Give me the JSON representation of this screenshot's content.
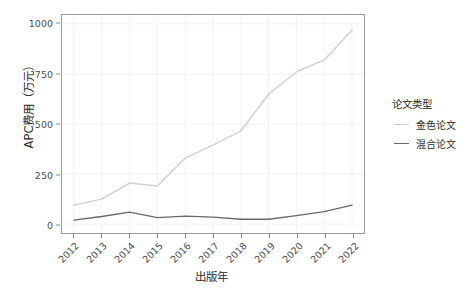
{
  "chart_data": {
    "type": "line",
    "title": "",
    "xlabel": "出版年",
    "ylabel": "APC费用（万元）",
    "categories": [
      "2012",
      "2013",
      "2014",
      "2015",
      "2016",
      "2017",
      "2018",
      "2019",
      "2020",
      "2021",
      "2022"
    ],
    "x": [
      2012,
      2013,
      2014,
      2015,
      2016,
      2017,
      2018,
      2019,
      2020,
      2021,
      2022
    ],
    "xlim": [
      2012,
      2022
    ],
    "ylim": [
      0,
      1000
    ],
    "yticks": [
      0,
      250,
      500,
      750,
      1000
    ],
    "ytick_labels": [
      "0",
      "250",
      "500",
      "750",
      "1000"
    ],
    "xtick_labels": [
      "2012",
      "2013",
      "2014",
      "2015",
      "2016",
      "2017",
      "2018",
      "2019",
      "2020",
      "2021",
      "2022"
    ],
    "grid": true,
    "legend_position": "right",
    "legend_title": "论文类型",
    "series": [
      {
        "name": "金色论文",
        "color": "#cfcfcf",
        "values": [
          95,
          125,
          205,
          190,
          330,
          395,
          465,
          650,
          760,
          820,
          970
        ]
      },
      {
        "name": "混合论文",
        "color": "#686868",
        "values": [
          20,
          38,
          60,
          32,
          40,
          35,
          24,
          24,
          42,
          62,
          95
        ]
      }
    ]
  },
  "axes": {
    "y_title": "APC费用（万元）",
    "x_title": "出版年",
    "y_tick_labels": [
      "1000",
      "750",
      "500",
      "250",
      "0"
    ],
    "x_tick_labels": [
      "2012",
      "2013",
      "2014",
      "2015",
      "2016",
      "2017",
      "2018",
      "2019",
      "2020",
      "2021",
      "2022"
    ]
  },
  "legend": {
    "title": "论文类型",
    "items": [
      {
        "label": "金色论文",
        "color": "#cfcfcf"
      },
      {
        "label": "混合论文",
        "color": "#686868"
      }
    ]
  },
  "colors": {
    "panel_background": "#ffffff",
    "panel_border": "#9a9a9a",
    "grid": "#f2f2f2",
    "axis_text": "#4d4d4d",
    "title_text": "#2b2b2b",
    "gold_series": "#cfcfcf",
    "hybrid_series": "#686868"
  }
}
